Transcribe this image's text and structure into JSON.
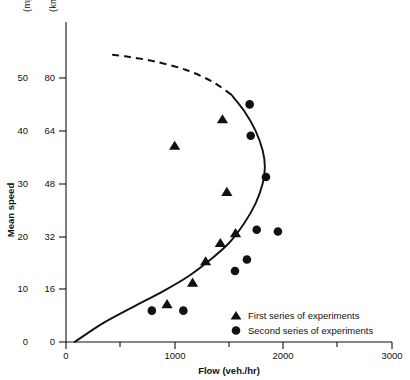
{
  "chart_data": {
    "type": "scatter",
    "title": "",
    "xlabel": "Flow (veh./hr)",
    "ylabel": "Mean speed",
    "xlim": [
      0,
      3000
    ],
    "ylim_kmh": [
      0,
      88
    ],
    "ylim_mph": [
      0,
      55
    ],
    "grid": false,
    "legend_position": "bottom-right",
    "x_ticks": [
      0,
      1000,
      2000,
      3000
    ],
    "x_tick_labels": [
      "0",
      "1000",
      "2000",
      "3000"
    ],
    "x_minor_ticks": [
      500,
      1500,
      2500
    ],
    "y_ticks_kmh": [
      0,
      16,
      32,
      48,
      64,
      80
    ],
    "y_tick_labels_kmh": [
      "0",
      "16",
      "32",
      "48",
      "64",
      "80"
    ],
    "y_ticks_mph": [
      0,
      10,
      20,
      30,
      40,
      50
    ],
    "y_tick_labels_mph": [
      "0",
      "10",
      "20",
      "30",
      "40",
      "50"
    ],
    "unit_label_left": "(mph)",
    "unit_label_right": "(km/hr)",
    "series": [
      {
        "name": "First series of experiments",
        "marker": "triangle",
        "color": "#111111",
        "points": [
          {
            "x": 930,
            "y": 11.5
          },
          {
            "x": 1165,
            "y": 18.0
          },
          {
            "x": 1285,
            "y": 24.5
          },
          {
            "x": 1420,
            "y": 30.0
          },
          {
            "x": 1560,
            "y": 33.0
          },
          {
            "x": 1480,
            "y": 45.5
          },
          {
            "x": 1000,
            "y": 59.5
          },
          {
            "x": 1440,
            "y": 67.5
          }
        ]
      },
      {
        "name": "Second series of experiments",
        "marker": "circle",
        "color": "#111111",
        "points": [
          {
            "x": 790,
            "y": 9.5
          },
          {
            "x": 1080,
            "y": 9.5
          },
          {
            "x": 1555,
            "y": 21.5
          },
          {
            "x": 1665,
            "y": 25.0
          },
          {
            "x": 1950,
            "y": 33.5
          },
          {
            "x": 1755,
            "y": 34.0
          },
          {
            "x": 1840,
            "y": 50.0
          },
          {
            "x": 1700,
            "y": 62.5
          },
          {
            "x": 1690,
            "y": 72.0
          }
        ]
      }
    ],
    "fitted_curve": {
      "name": "speed-flow relationship",
      "stable_branch": {
        "style": "solid",
        "points": [
          {
            "x": 80,
            "y": 0
          },
          {
            "x": 330,
            "y": 5.5
          },
          {
            "x": 610,
            "y": 10.5
          },
          {
            "x": 900,
            "y": 15.5
          },
          {
            "x": 1130,
            "y": 20.0
          },
          {
            "x": 1330,
            "y": 25.0
          },
          {
            "x": 1500,
            "y": 30.0
          },
          {
            "x": 1640,
            "y": 36.0
          },
          {
            "x": 1745,
            "y": 42.0
          },
          {
            "x": 1810,
            "y": 48.0
          },
          {
            "x": 1830,
            "y": 53.0
          },
          {
            "x": 1810,
            "y": 58.0
          },
          {
            "x": 1745,
            "y": 64.0
          },
          {
            "x": 1640,
            "y": 70.0
          },
          {
            "x": 1520,
            "y": 75.0
          }
        ]
      },
      "unstable_branch": {
        "style": "dashed",
        "points": [
          {
            "x": 1520,
            "y": 75.0
          },
          {
            "x": 1340,
            "y": 79.0
          },
          {
            "x": 1100,
            "y": 82.5
          },
          {
            "x": 820,
            "y": 85.0
          },
          {
            "x": 560,
            "y": 86.5
          },
          {
            "x": 380,
            "y": 87.2
          }
        ]
      }
    },
    "legend": [
      {
        "marker": "triangle",
        "label": "First series of experiments"
      },
      {
        "marker": "circle",
        "label": "Second series of experiments"
      }
    ]
  }
}
